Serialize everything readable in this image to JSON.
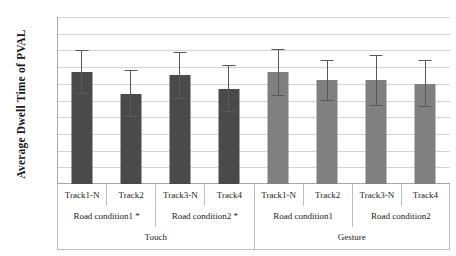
{
  "chart_data": {
    "type": "bar",
    "title": "",
    "xlabel": "",
    "ylabel": "Average Dwell Time of PVAL",
    "ylim": [
      0,
      100
    ],
    "ytick_labels": [
      "100%",
      "90%",
      "80%",
      "70%",
      "60%",
      "50%",
      "40%",
      "30%",
      "20%",
      "10%",
      "0%"
    ],
    "ytick_values": [
      100,
      90,
      80,
      70,
      60,
      50,
      40,
      30,
      20,
      10,
      0
    ],
    "grid": true,
    "legend": "none",
    "units": "percent",
    "categories": [
      "Track1-N",
      "Track2",
      "Track3-N",
      "Track4",
      "Track1-N",
      "Track2",
      "Track3-N",
      "Track4"
    ],
    "values": [
      67,
      54,
      65,
      57,
      67,
      62,
      62,
      60
    ],
    "error_upper": [
      80,
      68,
      79,
      71,
      81,
      74,
      77,
      74
    ],
    "error_lower": [
      54,
      40,
      51,
      43,
      53,
      50,
      47,
      46
    ],
    "bar_colors": [
      "#4a4a4a",
      "#4a4a4a",
      "#4a4a4a",
      "#4a4a4a",
      "#808080",
      "#808080",
      "#808080",
      "#808080"
    ],
    "group_level_1": [
      {
        "label": "Track1-N",
        "span": 1
      },
      {
        "label": "Track2",
        "span": 1
      },
      {
        "label": "Track3-N",
        "span": 1
      },
      {
        "label": "Track4",
        "span": 1
      },
      {
        "label": "Track1-N",
        "span": 1
      },
      {
        "label": "Track2",
        "span": 1
      },
      {
        "label": "Track3-N",
        "span": 1
      },
      {
        "label": "Track4",
        "span": 1
      }
    ],
    "group_level_2": [
      {
        "label": "Road condition1 *",
        "span": 2
      },
      {
        "label": "Road condition2 *",
        "span": 2
      },
      {
        "label": "Road condition1",
        "span": 2
      },
      {
        "label": "Road condition2",
        "span": 2
      }
    ],
    "group_level_3": [
      {
        "label": "Touch",
        "span": 4
      },
      {
        "label": "Gesture",
        "span": 4
      }
    ],
    "annotations": [
      "* denotes statistical significance"
    ]
  },
  "colors": {
    "touch_bar": "#4a4a4a",
    "gesture_bar": "#808080",
    "gridline": "#d4d4d4",
    "axis": "#a8a8a8",
    "text": "#1a1a1a"
  }
}
